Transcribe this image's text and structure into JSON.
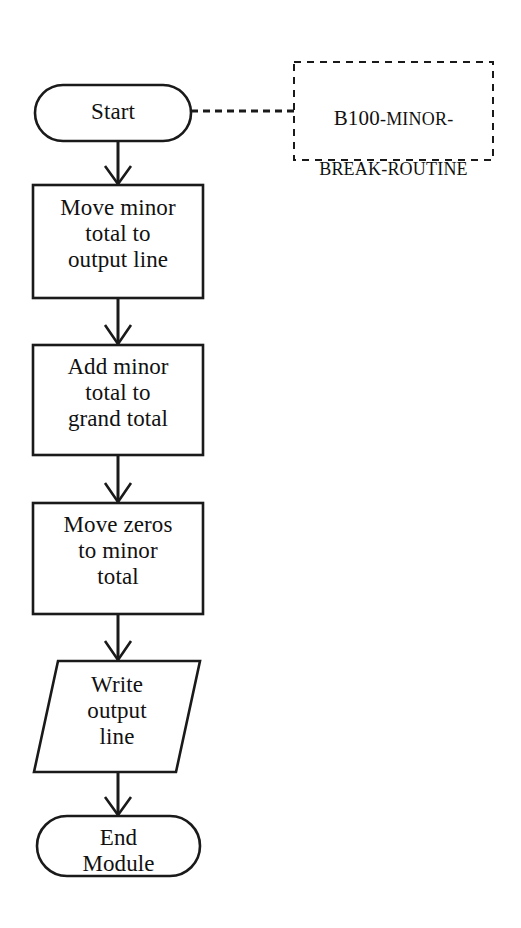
{
  "figure": {
    "background_color": "#ffffff",
    "line_color": "#1a1a1a"
  },
  "annotation": {
    "module_name_lead": "B100",
    "module_name_rest": "-MINOR-",
    "module_name_line2": "BREAK-ROUTINE",
    "full_text": "B100-MINOR-BREAK-ROUTINE"
  },
  "nodes": [
    {
      "id": "start",
      "shape": "terminator",
      "label": "Start"
    },
    {
      "id": "move-minor-total",
      "shape": "process",
      "label": "Move minor\ntotal to\noutput line"
    },
    {
      "id": "add-minor-total",
      "shape": "process",
      "label": "Add minor\ntotal to\ngrand total"
    },
    {
      "id": "move-zeros",
      "shape": "process",
      "label": "Move zeros\nto minor\ntotal"
    },
    {
      "id": "write-output-line",
      "shape": "input-output",
      "label": "Write\noutput\nline"
    },
    {
      "id": "end-module",
      "shape": "terminator",
      "label": "End\nModule"
    }
  ],
  "connectors": [
    {
      "id": "start-to-move-minor",
      "style": "solid-arrow"
    },
    {
      "id": "move-minor-to-add-minor",
      "style": "solid-arrow"
    },
    {
      "id": "add-minor-to-move-zeros",
      "style": "solid-arrow"
    },
    {
      "id": "move-zeros-to-write",
      "style": "solid-arrow"
    },
    {
      "id": "write-to-end",
      "style": "solid-arrow"
    },
    {
      "id": "start-to-annotation",
      "style": "dashed"
    }
  ]
}
